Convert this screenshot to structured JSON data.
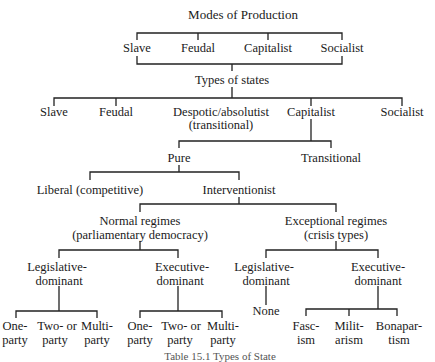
{
  "title": "Modes of Production",
  "modes": [
    "Slave",
    "Feudal",
    "Capitalist",
    "Socialist"
  ],
  "types_heading": "Types of states",
  "state_types": [
    "Slave",
    "Feudal",
    "Despotic/absolutist",
    "Capitalist",
    "Socialist"
  ],
  "despotic_sub": "(transitional)",
  "capitalist_children": [
    "Pure",
    "Transitional"
  ],
  "pure_children": [
    "Liberal (competitive)",
    "Interventionist"
  ],
  "interventionist_children": {
    "normal": [
      "Normal regimes",
      "(parliamentary democracy)"
    ],
    "exceptional": [
      "Exceptional regimes",
      "(crisis types)"
    ]
  },
  "normal_children": {
    "legislative": [
      "Legislative-",
      "dominant"
    ],
    "executive": [
      "Executive-",
      "dominant"
    ]
  },
  "exceptional_children": {
    "legislative": [
      "Legislative-",
      "dominant"
    ],
    "executive": [
      "Executive-",
      "dominant"
    ]
  },
  "normal_leg_leaves": [
    [
      "One-",
      "party"
    ],
    [
      "Two- or",
      "party"
    ],
    [
      "Multi-",
      "party"
    ]
  ],
  "normal_exec_leaves": [
    [
      "One-",
      "party"
    ],
    [
      "Two- or",
      "party"
    ],
    [
      "Multi-",
      "party"
    ]
  ],
  "exc_leg_leaf": "None",
  "exc_exec_leaves": [
    [
      "Fasc-",
      "ism"
    ],
    [
      "Milit-",
      "arism"
    ],
    [
      "Bonapar-",
      "tism"
    ]
  ],
  "caption": "Table 15.1   Types of State"
}
